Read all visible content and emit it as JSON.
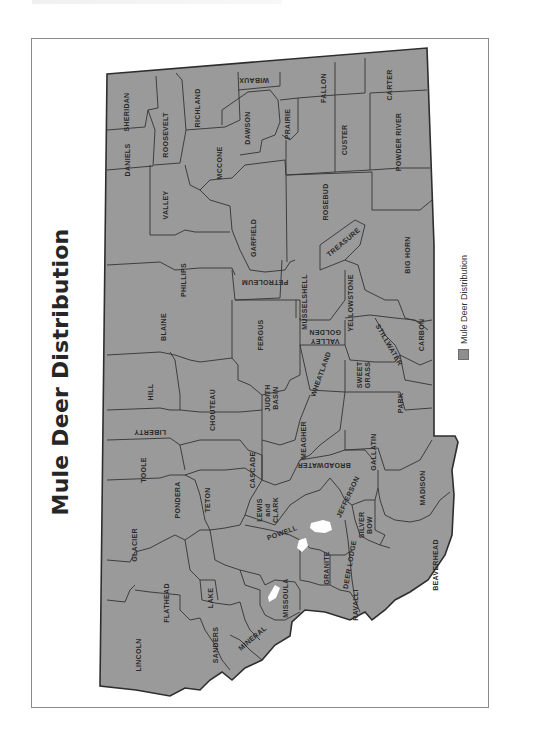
{
  "figure": {
    "title": "Mule Deer Distribution",
    "orientation": "rotated 90 degrees counter-clockwise"
  },
  "legend": {
    "items": [
      {
        "label": "Mule Deer Distribution",
        "swatch_color": "#8e8e8e"
      }
    ]
  },
  "colors": {
    "distribution_fill": "#9a9a9a",
    "county_border": "#333333",
    "not_occupied": "#ffffff",
    "page_frame": "#8a8a8a"
  },
  "map": {
    "region": "Montana",
    "counties": [
      {
        "name": "SHERIDAN",
        "lines": [
          "SHERIDAN"
        ]
      },
      {
        "name": "DANIELS",
        "lines": [
          "DANIELS"
        ]
      },
      {
        "name": "ROOSEVELT",
        "lines": [
          "ROOSEVELT"
        ]
      },
      {
        "name": "RICHLAND",
        "lines": [
          "RICHLAND"
        ]
      },
      {
        "name": "WIBAUX",
        "lines": [
          "WIBAUX"
        ]
      },
      {
        "name": "DAWSON",
        "lines": [
          "DAWSON"
        ]
      },
      {
        "name": "PRAIRIE",
        "lines": [
          "PRAIRIE"
        ]
      },
      {
        "name": "FALLON",
        "lines": [
          "FALLON"
        ]
      },
      {
        "name": "CARTER",
        "lines": [
          "CARTER"
        ]
      },
      {
        "name": "CUSTER",
        "lines": [
          "CUSTER"
        ]
      },
      {
        "name": "POWDER RIVER",
        "lines": [
          "POWDER RIVER"
        ]
      },
      {
        "name": "MCCONE",
        "lines": [
          "MCCONE"
        ]
      },
      {
        "name": "VALLEY",
        "lines": [
          "VALLEY"
        ]
      },
      {
        "name": "GARFIELD",
        "lines": [
          "GARFIELD"
        ]
      },
      {
        "name": "ROSEBUD",
        "lines": [
          "ROSEBUD"
        ]
      },
      {
        "name": "TREASURE",
        "lines": [
          "TREASURE"
        ]
      },
      {
        "name": "BIG HORN",
        "lines": [
          "BIG HORN"
        ]
      },
      {
        "name": "PHILLIPS",
        "lines": [
          "PHILLIPS"
        ]
      },
      {
        "name": "PETROLEUM",
        "lines": [
          "PETROLEUM"
        ]
      },
      {
        "name": "MUSSELSHELL",
        "lines": [
          "MUSSELSHELL"
        ]
      },
      {
        "name": "YELLOWSTONE",
        "lines": [
          "YELLOWSTONE"
        ]
      },
      {
        "name": "GOLDEN VALLEY",
        "lines": [
          "GOLDEN",
          "VALLEY"
        ]
      },
      {
        "name": "STILLWATER",
        "lines": [
          "STILLWATER"
        ]
      },
      {
        "name": "CARBON",
        "lines": [
          "CARBON"
        ]
      },
      {
        "name": "BLAINE",
        "lines": [
          "BLAINE"
        ]
      },
      {
        "name": "FERGUS",
        "lines": [
          "FERGUS"
        ]
      },
      {
        "name": "WHEATLAND",
        "lines": [
          "WHEATLAND"
        ]
      },
      {
        "name": "SWEET GRASS",
        "lines": [
          "SWEET",
          "GRASS"
        ]
      },
      {
        "name": "HILL",
        "lines": [
          "HILL"
        ]
      },
      {
        "name": "CHOUTEAU",
        "lines": [
          "CHOUTEAU"
        ]
      },
      {
        "name": "JUDITH BASIN",
        "lines": [
          "JUDITH",
          "BASIN"
        ]
      },
      {
        "name": "PARK",
        "lines": [
          "PARK"
        ]
      },
      {
        "name": "LIBERTY",
        "lines": [
          "LIBERTY"
        ]
      },
      {
        "name": "MEAGHER",
        "lines": [
          "MEAGHER"
        ]
      },
      {
        "name": "GALLATIN",
        "lines": [
          "GALLATIN"
        ]
      },
      {
        "name": "TOOLE",
        "lines": [
          "TOOLE"
        ]
      },
      {
        "name": "CASCADE",
        "lines": [
          "CASCADE"
        ]
      },
      {
        "name": "BROADWATER",
        "lines": [
          "BROADWATER"
        ]
      },
      {
        "name": "PONDERA",
        "lines": [
          "PONDERA"
        ]
      },
      {
        "name": "TETON",
        "lines": [
          "TETON"
        ]
      },
      {
        "name": "LEWIS AND CLARK",
        "lines": [
          "LEWIS",
          "and",
          "CLARK"
        ]
      },
      {
        "name": "JEFFERSON",
        "lines": [
          "JEFFERSON"
        ]
      },
      {
        "name": "MADISON",
        "lines": [
          "MADISON"
        ]
      },
      {
        "name": "GLACIER",
        "lines": [
          "GLACIER"
        ]
      },
      {
        "name": "POWELL",
        "lines": [
          "POWELL"
        ]
      },
      {
        "name": "SILVER BOW",
        "lines": [
          "SILVER",
          "BOW"
        ]
      },
      {
        "name": "DEER LODGE",
        "lines": [
          "DEER LODGE"
        ]
      },
      {
        "name": "BEAVERHEAD",
        "lines": [
          "BEAVERHEAD"
        ]
      },
      {
        "name": "GRANITE",
        "lines": [
          "GRANITE"
        ]
      },
      {
        "name": "FLATHEAD",
        "lines": [
          "FLATHEAD"
        ]
      },
      {
        "name": "LAKE",
        "lines": [
          "LAKE"
        ]
      },
      {
        "name": "MISSOULA",
        "lines": [
          "MISSOULA"
        ]
      },
      {
        "name": "RAVALLI",
        "lines": [
          "RAVALLI"
        ]
      },
      {
        "name": "SANDERS",
        "lines": [
          "SANDERS"
        ]
      },
      {
        "name": "MINERAL",
        "lines": [
          "MINERAL"
        ]
      },
      {
        "name": "LINCOLN",
        "lines": [
          "LINCOLN"
        ]
      }
    ],
    "unoccupied_areas": [
      {
        "near": "POWELL / DEER LODGE"
      },
      {
        "near": "GRANITE / MISSOULA (north)"
      },
      {
        "near": "MISSOULA"
      }
    ]
  }
}
